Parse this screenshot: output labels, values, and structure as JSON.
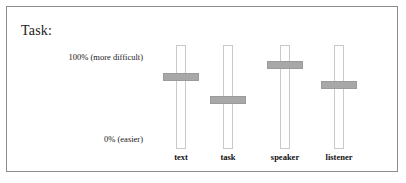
{
  "panel": {
    "title": "Task:",
    "border_color": "#8c8c8c",
    "background": "#ffffff"
  },
  "scale": {
    "top_label": "100% (more difficult)",
    "bottom_label": "0% (easier)",
    "max_percent": "100%",
    "min_percent": "0%"
  },
  "slider_style": {
    "thumb_color": "#a8a8a8",
    "track_border_color": "#c9c9c9",
    "track_fill": "#ffffff"
  },
  "sliders": [
    {
      "name": "text",
      "label": "text",
      "value_percent": 71,
      "thumb_top_px": 66
    },
    {
      "name": "task",
      "label": "task",
      "value_percent": 49,
      "thumb_top_px": 89
    },
    {
      "name": "speaker",
      "label": "speaker",
      "value_percent": 83,
      "thumb_top_px": 54
    },
    {
      "name": "listener",
      "label": "listener",
      "value_percent": 64,
      "thumb_top_px": 74
    }
  ],
  "layout": {
    "slider_left_px": [
      139,
      186,
      243,
      297
    ]
  }
}
